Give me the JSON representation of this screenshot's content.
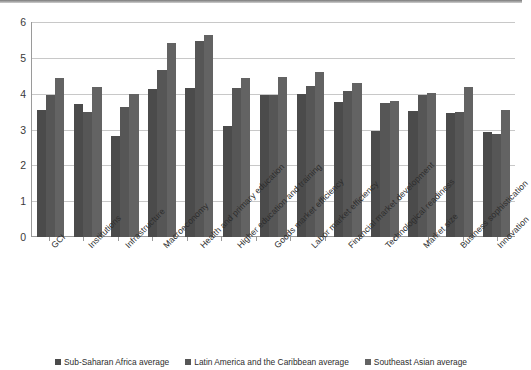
{
  "chart_data": {
    "type": "bar",
    "title": "",
    "subtitle": "",
    "xlabel": "",
    "ylabel": "",
    "ylim": [
      0,
      6
    ],
    "yticks": [
      0,
      1,
      2,
      3,
      4,
      5,
      6
    ],
    "ytick_labels": [
      "0",
      "1",
      "2",
      "3",
      "4",
      "5",
      "6"
    ],
    "grid": true,
    "legend_position": "bottom",
    "categories": [
      "GCI",
      "Institutions",
      "Infrastructure",
      "Macroeconomy",
      "Health and primary education",
      "Higher education and training",
      "Goods market efficiency",
      "Labor market efficiency",
      "Financial market development",
      "Technological readiness",
      "Market size",
      "Business sophistication",
      "Innovation"
    ],
    "series": [
      {
        "name": "Sub-Saharan Africa average",
        "color": "#4b4b4b",
        "values": [
          3.55,
          3.72,
          2.81,
          4.13,
          4.17,
          3.1,
          3.97,
          4.0,
          3.77,
          2.95,
          3.52,
          3.45,
          2.93
        ]
      },
      {
        "name": "Latin America and the Caribbean average",
        "color": "#565656",
        "values": [
          3.96,
          3.5,
          3.62,
          4.65,
          5.47,
          4.15,
          3.97,
          4.22,
          4.08,
          3.73,
          3.97,
          3.5,
          2.88
        ]
      },
      {
        "name": "Southeast Asian average",
        "color": "#636363",
        "values": [
          4.43,
          4.19,
          3.99,
          5.41,
          5.65,
          4.44,
          4.46,
          4.6,
          4.3,
          3.8,
          4.03,
          4.18,
          3.54
        ]
      }
    ]
  },
  "legend": {
    "items": [
      {
        "label": "Sub-Saharan Africa average",
        "color": "#4b4b4b"
      },
      {
        "label": "Latin America and the Caribbean average",
        "color": "#565656"
      },
      {
        "label": "Southeast Asian average",
        "color": "#636363"
      }
    ]
  }
}
